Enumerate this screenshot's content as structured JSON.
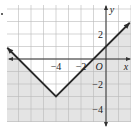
{
  "chart_data": {
    "type": "line",
    "title": "",
    "function": "y = |x + 4| - 3",
    "vertex": [
      -4,
      -3
    ],
    "series": [
      {
        "name": "boundary",
        "style": "solid",
        "points": [
          [
            -7.9,
            0.9
          ],
          [
            -4,
            -3
          ],
          [
            1.9,
            2.9
          ]
        ],
        "arrows": "both"
      }
    ],
    "shaded_region": "below boundary (outside the V)",
    "xlabel": "x",
    "ylabel": "y",
    "origin_label": "O",
    "x_ticks": [
      {
        "value": -4,
        "label": "−4"
      },
      {
        "value": -2,
        "label": "−2"
      }
    ],
    "y_ticks": [
      {
        "value": 2,
        "label": "2"
      },
      {
        "value": -2,
        "label": "−2"
      },
      {
        "value": -4,
        "label": "−4"
      }
    ],
    "xlim": [
      -7.9,
      2
    ],
    "ylim": [
      -5,
      4.3
    ],
    "grid": true,
    "colors": {
      "shade": "#e4e4e4",
      "grid": "#b8b8b8",
      "line": "#2a2a2a",
      "axis": "#333333",
      "text": "#222222"
    }
  },
  "layout": {
    "origin_px": [
      106,
      59
    ],
    "unit_px": 12.5,
    "plot_box": {
      "left": 7,
      "top": 5,
      "right": 131,
      "bottom": 122
    }
  }
}
